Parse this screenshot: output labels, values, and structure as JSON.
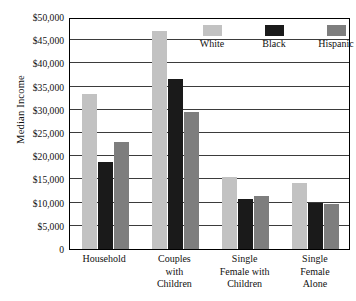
{
  "chart_data": {
    "type": "bar",
    "title": "",
    "subtitle": "",
    "xlabel": "",
    "ylabel": "Median Income",
    "ylim": [
      0,
      50000
    ],
    "ytick_step": 5000,
    "grid": true,
    "legend_position": "top-right-inside",
    "categories": [
      "Household",
      "Couples with Children",
      "Single Female with Children",
      "Single Female Alone"
    ],
    "category_lines": [
      [
        "Household"
      ],
      [
        "Couples",
        "with",
        "Children"
      ],
      [
        "Single",
        "Female with",
        "Children"
      ],
      [
        "Single",
        "Female",
        "Alone"
      ]
    ],
    "ytick_labels": [
      "$50,000",
      "$45,000",
      "$40,000",
      "$35,000",
      "$30,000",
      "$25,000",
      "$20,000",
      "$15,000",
      "$10,000",
      "$5,000",
      "0"
    ],
    "ytick_values": [
      50000,
      45000,
      40000,
      35000,
      30000,
      25000,
      20000,
      15000,
      10000,
      5000,
      0
    ],
    "series": [
      {
        "name": "White",
        "color": "#c2c2c2",
        "values": [
          33400,
          47000,
          15600,
          14300
        ]
      },
      {
        "name": "Black",
        "color": "#1a1a1a",
        "values": [
          18700,
          36700,
          10800,
          9900
        ]
      },
      {
        "name": "Hispanic",
        "color": "#7e7e7e",
        "values": [
          23000,
          29500,
          11500,
          9700
        ]
      }
    ]
  },
  "legend": {
    "items": [
      {
        "label": "White",
        "color": "#c2c2c2"
      },
      {
        "label": "Black",
        "color": "#1a1a1a"
      },
      {
        "label": "Hispanic",
        "color": "#7e7e7e"
      }
    ]
  }
}
